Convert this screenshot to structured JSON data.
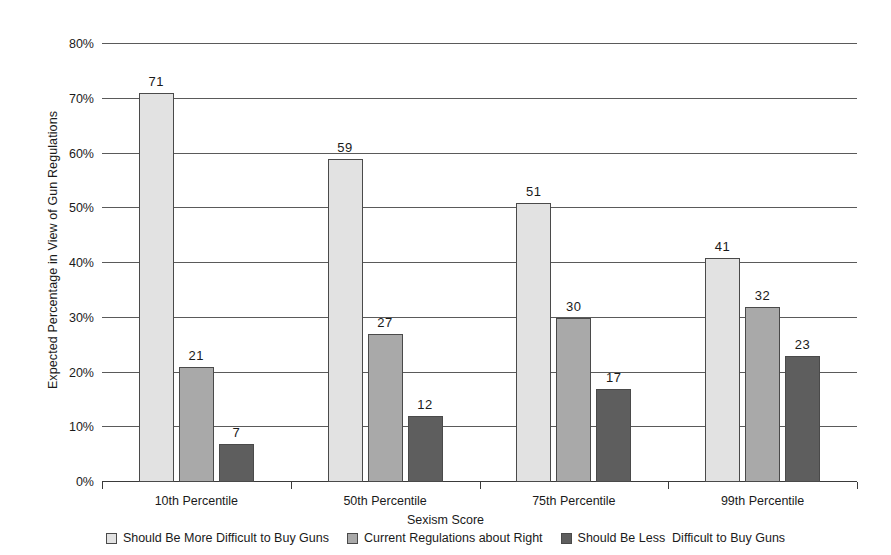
{
  "chart_data": {
    "type": "bar",
    "title": "",
    "xlabel": "Sexism Score",
    "ylabel": "Expected Percentage in View of Gun Regulations",
    "categories": [
      "10th Percentile",
      "50th Percentile",
      "75th Percentile",
      "99th Percentile"
    ],
    "series": [
      {
        "name": "Should Be More Difficult to Buy Guns",
        "color": "#e2e2e2",
        "values": [
          71,
          59,
          51,
          41
        ]
      },
      {
        "name": "Current Regulations about Right",
        "color": "#a9a9a9",
        "values": [
          21,
          27,
          30,
          32
        ]
      },
      {
        "name": "Should Be Less  Difficult to Buy Guns",
        "color": "#5e5e5e",
        "values": [
          7,
          12,
          17,
          23
        ]
      }
    ],
    "ylim": [
      0,
      80
    ],
    "ytick_labels": [
      "0%",
      "10%",
      "20%",
      "30%",
      "40%",
      "50%",
      "60%",
      "70%",
      "80%"
    ],
    "ytick_values": [
      0,
      10,
      20,
      30,
      40,
      50,
      60,
      70,
      80
    ],
    "grid": true,
    "legend_position": "bottom"
  }
}
